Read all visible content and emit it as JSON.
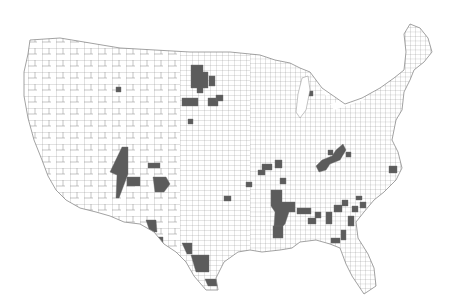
{
  "map": {
    "type": "choropleth",
    "region": "contiguous-united-states",
    "unit": "county",
    "colors": {
      "background": "#ffffff",
      "county_fill": "#ffffff",
      "county_border": "#8a8a8a",
      "highlight_fill": "#5c5c5c"
    },
    "legend": null,
    "title": null,
    "highlighted_regions": [
      {
        "name": "north-dakota-south-dakota-cluster",
        "points": "191,65 203,65 203,72 208,72 208,88 203,88 203,93 197,93 197,88 191,88"
      },
      {
        "name": "north-dakota-east-block",
        "points": "209,76 215,76 215,86 209,86"
      },
      {
        "name": "north-dakota-top",
        "points": "205,43 211,43 211,49 205,49"
      },
      {
        "name": "south-dakota-south-west",
        "points": "182,98 198,98 198,106 182,106"
      },
      {
        "name": "south-dakota-south-east",
        "points": "208,98 218,98 218,106 208,106"
      },
      {
        "name": "south-dakota-east-small",
        "points": "216,95 223,95 223,101 216,101"
      },
      {
        "name": "nebraska-small",
        "points": "188,119 193,119 193,124 188,124"
      },
      {
        "name": "montana-single",
        "points": "116,87 121,87 121,92 116,92"
      },
      {
        "name": "arizona-new-mexico-strip",
        "points": "122,147 128,147 128,174 119,198 116,198 117,175 110,172"
      },
      {
        "name": "new-mexico-block",
        "points": "127,177 140,177 140,186 127,186"
      },
      {
        "name": "new-mexico-north",
        "points": "148,163 160,163 160,168 148,168"
      },
      {
        "name": "new-mexico-east",
        "points": "153,177 166,177 170,184 164,192 155,192"
      },
      {
        "name": "texas-big-bend",
        "points": "146,220 156,220 157,232 150,232"
      },
      {
        "name": "texas-west-border",
        "points": "155,237 163,237 163,250 160,250"
      },
      {
        "name": "texas-del-rio",
        "points": "182,243 192,243 192,254 187,254"
      },
      {
        "name": "texas-south-cluster",
        "points": "191,255 209,255 209,272 196,272"
      },
      {
        "name": "texas-rio-grande-valley",
        "points": "205,279 218,279 220,286 208,286"
      },
      {
        "name": "mississippi-delta-cluster",
        "points": "271,190 282,190 282,202 295,202 295,212 289,212 285,224 279,230 274,226 275,212 271,206"
      },
      {
        "name": "louisiana-north",
        "points": "273,226 283,226 283,238 273,238"
      },
      {
        "name": "arkansas-block",
        "points": "262,164 272,164 272,170 262,170"
      },
      {
        "name": "arkansas-east",
        "points": "275,160 282,160 282,168 275,168"
      },
      {
        "name": "missouri-boot",
        "points": "280,178 286,178 286,184 280,184"
      },
      {
        "name": "alabama-belt-1",
        "points": "297,208 311,208 311,214 297,214"
      },
      {
        "name": "alabama-belt-2",
        "points": "308,218 316,218 316,224 308,224"
      },
      {
        "name": "alabama-belt-3",
        "points": "315,212 321,212 321,218 315,218"
      },
      {
        "name": "georgia-belt-1",
        "points": "326,212 332,212 332,224 326,224"
      },
      {
        "name": "georgia-belt-2",
        "points": "334,205 342,205 342,212 334,212"
      },
      {
        "name": "georgia-belt-3",
        "points": "348,216 354,216 354,226 348,226"
      },
      {
        "name": "florida-panhandle",
        "points": "331,238 340,238 340,243 331,243"
      },
      {
        "name": "georgia-south",
        "points": "341,230 346,230 346,240 341,240"
      },
      {
        "name": "south-carolina-1",
        "points": "342,200 348,200 348,206 342,206"
      },
      {
        "name": "south-carolina-2",
        "points": "352,206 358,206 358,212 352,212"
      },
      {
        "name": "south-carolina-3",
        "points": "360,202 366,202 366,208 360,208"
      },
      {
        "name": "south-carolina-4",
        "points": "356,196 362,196 362,200 356,200"
      },
      {
        "name": "kentucky-tennessee-cluster",
        "points": "336,150 343,144 346,150 340,160 330,164 326,170 319,172 316,166 322,160 332,156"
      },
      {
        "name": "kentucky-small-1",
        "points": "328,150 333,150 333,155 328,155"
      },
      {
        "name": "kentucky-small-2",
        "points": "346,152 351,152 351,157 346,157"
      },
      {
        "name": "north-carolina-coast",
        "points": "389,166 397,166 397,173 389,173"
      },
      {
        "name": "tennessee-west",
        "points": "246,182 252,182 252,187 246,187"
      },
      {
        "name": "michigan-west",
        "points": "308,91 313,91 313,96 308,96"
      },
      {
        "name": "oklahoma-east",
        "points": "224,196 231,196 231,201 224,201"
      },
      {
        "name": "mississippi-east",
        "points": "258,170 265,170 265,175 258,175"
      }
    ]
  }
}
